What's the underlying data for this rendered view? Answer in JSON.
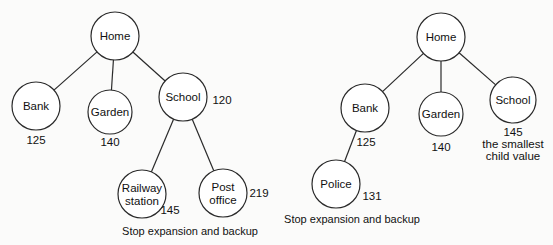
{
  "diagram": {
    "type": "search-tree-comparison",
    "trees": [
      {
        "id": "left",
        "nodes": [
          {
            "id": "home",
            "label": [
              "Home"
            ],
            "cx": 115,
            "cy": 36,
            "r": 24
          },
          {
            "id": "bank",
            "label": [
              "Bank"
            ],
            "cx": 36,
            "cy": 106,
            "r": 24
          },
          {
            "id": "garden",
            "label": [
              "Garden"
            ],
            "cx": 110,
            "cy": 112,
            "r": 22
          },
          {
            "id": "school",
            "label": [
              "School"
            ],
            "cx": 183,
            "cy": 97,
            "r": 24
          },
          {
            "id": "railway",
            "label": [
              "Railway",
              "station"
            ],
            "cx": 142,
            "cy": 194,
            "r": 24
          },
          {
            "id": "postoffice",
            "label": [
              "Post",
              "office"
            ],
            "cx": 223,
            "cy": 193,
            "r": 24
          }
        ],
        "edges": [
          [
            "home",
            "bank"
          ],
          [
            "home",
            "garden"
          ],
          [
            "home",
            "school"
          ],
          [
            "school",
            "railway"
          ],
          [
            "school",
            "postoffice"
          ]
        ],
        "values": [
          {
            "node": "bank",
            "text": "125",
            "x": 36,
            "y": 144
          },
          {
            "node": "garden",
            "text": "140",
            "x": 110,
            "y": 146
          },
          {
            "node": "school",
            "text": "120",
            "x": 222,
            "y": 104
          },
          {
            "node": "railway",
            "text": "145",
            "x": 170,
            "y": 214
          },
          {
            "node": "postoffice",
            "text": "219",
            "x": 259,
            "y": 197
          }
        ],
        "caption": {
          "text": "Stop expansion and backup",
          "x": 190,
          "y": 235
        }
      },
      {
        "id": "right",
        "nodes": [
          {
            "id": "home",
            "label": [
              "Home"
            ],
            "cx": 441,
            "cy": 37,
            "r": 24
          },
          {
            "id": "bank",
            "label": [
              "Bank"
            ],
            "cx": 365,
            "cy": 108,
            "r": 24
          },
          {
            "id": "garden",
            "label": [
              "Garden"
            ],
            "cx": 441,
            "cy": 114,
            "r": 22
          },
          {
            "id": "school",
            "label": [
              "School"
            ],
            "cx": 513,
            "cy": 100,
            "r": 23
          },
          {
            "id": "police",
            "label": [
              "Police"
            ],
            "cx": 336,
            "cy": 184,
            "r": 24
          }
        ],
        "edges": [
          [
            "home",
            "bank"
          ],
          [
            "home",
            "garden"
          ],
          [
            "home",
            "school"
          ],
          [
            "bank",
            "police"
          ]
        ],
        "values": [
          {
            "node": "bank",
            "text": "125",
            "x": 366,
            "y": 146
          },
          {
            "node": "garden",
            "text": "140",
            "x": 441,
            "y": 151
          },
          {
            "node": "school",
            "text": "145",
            "x": 513,
            "y": 136
          },
          {
            "node": "police",
            "text": "131",
            "x": 372,
            "y": 200
          }
        ],
        "annotations": [
          {
            "text": "the smallest",
            "x": 513,
            "y": 148
          },
          {
            "text": "child value",
            "x": 513,
            "y": 160
          }
        ],
        "caption": {
          "text": "Stop expansion and backup",
          "x": 352,
          "y": 223
        }
      }
    ]
  }
}
